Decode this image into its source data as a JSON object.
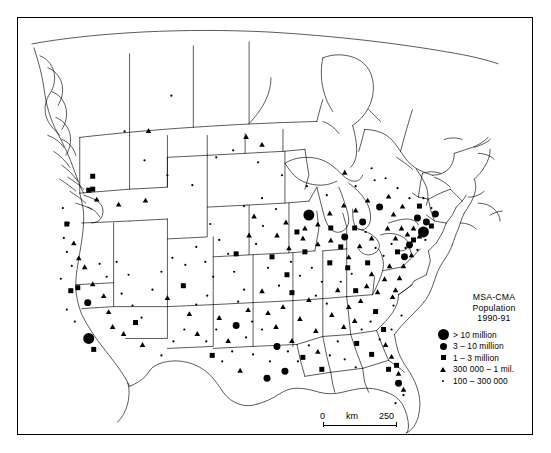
{
  "figure": {
    "background_color": "#ffffff",
    "symbol_color": "#000000",
    "border_color": "#000000"
  },
  "legend": {
    "title_line1": "MSA-CMA",
    "title_line2": "Population",
    "title_line3": "1990-91",
    "classes": [
      {
        "symbol": "large-circle",
        "label": "> 10 million",
        "size_px": 11.0
      },
      {
        "symbol": "medium-circle",
        "label": "3 – 10 million",
        "size_px": 7.0
      },
      {
        "symbol": "square",
        "label": "1 – 3 million",
        "size_px": 5.0
      },
      {
        "symbol": "triangle",
        "label": "300 000 – 1 mil.",
        "size_px": 5.4
      },
      {
        "symbol": "small-dot",
        "label": "100 – 300 000",
        "size_px": 2.2
      }
    ]
  },
  "scale": {
    "min_label": "0",
    "unit_label": "km",
    "max_label": "250"
  },
  "chart_data": {
    "type": "scatter",
    "title": "MSA-CMA Population 1990-91",
    "xlabel": "",
    "ylabel": "",
    "projection_note": "North America, conic projection, Canada and conterminous United States",
    "classes": [
      "> 10 million",
      "3 – 10 million",
      "1 – 3 million",
      "300 000 – 1 mil.",
      "100 – 300 000"
    ],
    "symbols": [
      "large-circle",
      "medium-circle",
      "square",
      "triangle",
      "small-dot"
    ],
    "points": [
      {
        "x": 88,
        "y": 339,
        "c": 0
      },
      {
        "x": 424,
        "y": 232,
        "c": 0
      },
      {
        "x": 309,
        "y": 215,
        "c": 0
      },
      {
        "x": 380,
        "y": 207,
        "c": 1
      },
      {
        "x": 418,
        "y": 218,
        "c": 1
      },
      {
        "x": 410,
        "y": 245,
        "c": 1
      },
      {
        "x": 405,
        "y": 257,
        "c": 1
      },
      {
        "x": 427,
        "y": 222,
        "c": 1
      },
      {
        "x": 436,
        "y": 214,
        "c": 1
      },
      {
        "x": 363,
        "y": 222,
        "c": 1
      },
      {
        "x": 345,
        "y": 237,
        "c": 1
      },
      {
        "x": 236,
        "y": 326,
        "c": 1
      },
      {
        "x": 277,
        "y": 347,
        "c": 1
      },
      {
        "x": 267,
        "y": 379,
        "c": 1
      },
      {
        "x": 285,
        "y": 372,
        "c": 1
      },
      {
        "x": 399,
        "y": 384,
        "c": 1
      },
      {
        "x": 87,
        "y": 303,
        "c": 1
      },
      {
        "x": 92,
        "y": 176,
        "c": 2
      },
      {
        "x": 92,
        "y": 189,
        "c": 2
      },
      {
        "x": 88,
        "y": 190,
        "c": 2
      },
      {
        "x": 66,
        "y": 224,
        "c": 2
      },
      {
        "x": 70,
        "y": 291,
        "c": 2
      },
      {
        "x": 77,
        "y": 288,
        "c": 2
      },
      {
        "x": 93,
        "y": 350,
        "c": 2
      },
      {
        "x": 135,
        "y": 323,
        "c": 2
      },
      {
        "x": 183,
        "y": 286,
        "c": 2
      },
      {
        "x": 236,
        "y": 254,
        "c": 2
      },
      {
        "x": 272,
        "y": 257,
        "c": 2
      },
      {
        "x": 287,
        "y": 275,
        "c": 2
      },
      {
        "x": 292,
        "y": 293,
        "c": 2
      },
      {
        "x": 305,
        "y": 252,
        "c": 2
      },
      {
        "x": 330,
        "y": 263,
        "c": 2
      },
      {
        "x": 341,
        "y": 247,
        "c": 2
      },
      {
        "x": 348,
        "y": 268,
        "c": 2
      },
      {
        "x": 356,
        "y": 291,
        "c": 2
      },
      {
        "x": 368,
        "y": 263,
        "c": 2
      },
      {
        "x": 376,
        "y": 312,
        "c": 2
      },
      {
        "x": 384,
        "y": 330,
        "c": 2
      },
      {
        "x": 303,
        "y": 358,
        "c": 2
      },
      {
        "x": 322,
        "y": 370,
        "c": 2
      },
      {
        "x": 212,
        "y": 356,
        "c": 2
      },
      {
        "x": 357,
        "y": 344,
        "c": 2
      },
      {
        "x": 372,
        "y": 355,
        "c": 2
      },
      {
        "x": 397,
        "y": 366,
        "c": 2
      },
      {
        "x": 389,
        "y": 370,
        "c": 2
      },
      {
        "x": 420,
        "y": 206,
        "c": 2
      },
      {
        "x": 432,
        "y": 226,
        "c": 2
      },
      {
        "x": 414,
        "y": 240,
        "c": 2
      },
      {
        "x": 398,
        "y": 252,
        "c": 2
      },
      {
        "x": 355,
        "y": 228,
        "c": 2
      },
      {
        "x": 331,
        "y": 228,
        "c": 2
      },
      {
        "x": 297,
        "y": 232,
        "c": 2
      },
      {
        "x": 148,
        "y": 130,
        "c": 3
      },
      {
        "x": 246,
        "y": 136,
        "c": 3
      },
      {
        "x": 262,
        "y": 144,
        "c": 3
      },
      {
        "x": 345,
        "y": 172,
        "c": 3
      },
      {
        "x": 96,
        "y": 199,
        "c": 3
      },
      {
        "x": 118,
        "y": 204,
        "c": 3
      },
      {
        "x": 145,
        "y": 200,
        "c": 3
      },
      {
        "x": 73,
        "y": 243,
        "c": 3
      },
      {
        "x": 78,
        "y": 258,
        "c": 3
      },
      {
        "x": 84,
        "y": 267,
        "c": 3
      },
      {
        "x": 92,
        "y": 284,
        "c": 3
      },
      {
        "x": 103,
        "y": 296,
        "c": 3
      },
      {
        "x": 108,
        "y": 312,
        "c": 3
      },
      {
        "x": 112,
        "y": 327,
        "c": 3
      },
      {
        "x": 123,
        "y": 334,
        "c": 3
      },
      {
        "x": 142,
        "y": 345,
        "c": 3
      },
      {
        "x": 167,
        "y": 298,
        "c": 3
      },
      {
        "x": 189,
        "y": 314,
        "c": 3
      },
      {
        "x": 197,
        "y": 334,
        "c": 3
      },
      {
        "x": 219,
        "y": 318,
        "c": 3
      },
      {
        "x": 228,
        "y": 341,
        "c": 3
      },
      {
        "x": 240,
        "y": 371,
        "c": 3
      },
      {
        "x": 248,
        "y": 310,
        "c": 3
      },
      {
        "x": 262,
        "y": 291,
        "c": 3
      },
      {
        "x": 268,
        "y": 313,
        "c": 3
      },
      {
        "x": 276,
        "y": 327,
        "c": 3
      },
      {
        "x": 283,
        "y": 307,
        "c": 3
      },
      {
        "x": 292,
        "y": 341,
        "c": 3
      },
      {
        "x": 300,
        "y": 319,
        "c": 3
      },
      {
        "x": 309,
        "y": 300,
        "c": 3
      },
      {
        "x": 316,
        "y": 331,
        "c": 3
      },
      {
        "x": 318,
        "y": 352,
        "c": 3
      },
      {
        "x": 332,
        "y": 315,
        "c": 3
      },
      {
        "x": 338,
        "y": 290,
        "c": 3
      },
      {
        "x": 344,
        "y": 327,
        "c": 3
      },
      {
        "x": 349,
        "y": 307,
        "c": 3
      },
      {
        "x": 355,
        "y": 321,
        "c": 3
      },
      {
        "x": 361,
        "y": 301,
        "c": 3
      },
      {
        "x": 367,
        "y": 286,
        "c": 3
      },
      {
        "x": 372,
        "y": 274,
        "c": 3
      },
      {
        "x": 378,
        "y": 292,
        "c": 3
      },
      {
        "x": 385,
        "y": 279,
        "c": 3
      },
      {
        "x": 390,
        "y": 266,
        "c": 3
      },
      {
        "x": 393,
        "y": 297,
        "c": 3
      },
      {
        "x": 386,
        "y": 345,
        "c": 3
      },
      {
        "x": 392,
        "y": 357,
        "c": 3
      },
      {
        "x": 399,
        "y": 374,
        "c": 3
      },
      {
        "x": 404,
        "y": 390,
        "c": 3
      },
      {
        "x": 331,
        "y": 240,
        "c": 3
      },
      {
        "x": 318,
        "y": 244,
        "c": 3
      },
      {
        "x": 303,
        "y": 238,
        "c": 3
      },
      {
        "x": 289,
        "y": 248,
        "c": 3
      },
      {
        "x": 277,
        "y": 235,
        "c": 3
      },
      {
        "x": 349,
        "y": 257,
        "c": 3
      },
      {
        "x": 360,
        "y": 246,
        "c": 3
      },
      {
        "x": 372,
        "y": 238,
        "c": 3
      },
      {
        "x": 388,
        "y": 228,
        "c": 3
      },
      {
        "x": 396,
        "y": 238,
        "c": 3
      },
      {
        "x": 402,
        "y": 228,
        "c": 3
      },
      {
        "x": 408,
        "y": 234,
        "c": 3
      },
      {
        "x": 414,
        "y": 228,
        "c": 3
      },
      {
        "x": 420,
        "y": 236,
        "c": 3
      },
      {
        "x": 412,
        "y": 255,
        "c": 3
      },
      {
        "x": 404,
        "y": 266,
        "c": 3
      },
      {
        "x": 400,
        "y": 278,
        "c": 3
      },
      {
        "x": 396,
        "y": 290,
        "c": 3
      },
      {
        "x": 368,
        "y": 200,
        "c": 3
      },
      {
        "x": 356,
        "y": 210,
        "c": 3
      },
      {
        "x": 344,
        "y": 205,
        "c": 3
      },
      {
        "x": 330,
        "y": 213,
        "c": 3
      },
      {
        "x": 318,
        "y": 224,
        "c": 3
      },
      {
        "x": 305,
        "y": 228,
        "c": 3
      },
      {
        "x": 286,
        "y": 222,
        "c": 3
      },
      {
        "x": 254,
        "y": 216,
        "c": 3
      },
      {
        "x": 249,
        "y": 235,
        "c": 3
      },
      {
        "x": 394,
        "y": 214,
        "c": 3
      },
      {
        "x": 403,
        "y": 206,
        "c": 3
      },
      {
        "x": 389,
        "y": 196,
        "c": 3
      },
      {
        "x": 124,
        "y": 131,
        "c": 4
      },
      {
        "x": 171,
        "y": 95,
        "c": 4
      },
      {
        "x": 144,
        "y": 160,
        "c": 4
      },
      {
        "x": 167,
        "y": 175,
        "c": 4
      },
      {
        "x": 192,
        "y": 185,
        "c": 4
      },
      {
        "x": 216,
        "y": 157,
        "c": 4
      },
      {
        "x": 233,
        "y": 150,
        "c": 4
      },
      {
        "x": 258,
        "y": 162,
        "c": 4
      },
      {
        "x": 282,
        "y": 175,
        "c": 4
      },
      {
        "x": 307,
        "y": 186,
        "c": 4
      },
      {
        "x": 327,
        "y": 195,
        "c": 4
      },
      {
        "x": 356,
        "y": 186,
        "c": 4
      },
      {
        "x": 375,
        "y": 180,
        "c": 4
      },
      {
        "x": 62,
        "y": 208,
        "c": 4
      },
      {
        "x": 68,
        "y": 223,
        "c": 4
      },
      {
        "x": 63,
        "y": 238,
        "c": 4
      },
      {
        "x": 66,
        "y": 252,
        "c": 4
      },
      {
        "x": 71,
        "y": 266,
        "c": 4
      },
      {
        "x": 60,
        "y": 279,
        "c": 4
      },
      {
        "x": 66,
        "y": 310,
        "c": 4
      },
      {
        "x": 74,
        "y": 322,
        "c": 4
      },
      {
        "x": 99,
        "y": 264,
        "c": 4
      },
      {
        "x": 106,
        "y": 277,
        "c": 4
      },
      {
        "x": 116,
        "y": 262,
        "c": 4
      },
      {
        "x": 128,
        "y": 275,
        "c": 4
      },
      {
        "x": 121,
        "y": 294,
        "c": 4
      },
      {
        "x": 132,
        "y": 306,
        "c": 4
      },
      {
        "x": 141,
        "y": 318,
        "c": 4
      },
      {
        "x": 152,
        "y": 290,
        "c": 4
      },
      {
        "x": 161,
        "y": 272,
        "c": 4
      },
      {
        "x": 172,
        "y": 258,
        "c": 4
      },
      {
        "x": 185,
        "y": 265,
        "c": 4
      },
      {
        "x": 196,
        "y": 247,
        "c": 4
      },
      {
        "x": 205,
        "y": 262,
        "c": 4
      },
      {
        "x": 213,
        "y": 277,
        "c": 4
      },
      {
        "x": 207,
        "y": 296,
        "c": 4
      },
      {
        "x": 196,
        "y": 305,
        "c": 4
      },
      {
        "x": 184,
        "y": 330,
        "c": 4
      },
      {
        "x": 173,
        "y": 342,
        "c": 4
      },
      {
        "x": 161,
        "y": 356,
        "c": 4
      },
      {
        "x": 206,
        "y": 342,
        "c": 4
      },
      {
        "x": 216,
        "y": 330,
        "c": 4
      },
      {
        "x": 222,
        "y": 362,
        "c": 4
      },
      {
        "x": 232,
        "y": 352,
        "c": 4
      },
      {
        "x": 246,
        "y": 338,
        "c": 4
      },
      {
        "x": 253,
        "y": 355,
        "c": 4
      },
      {
        "x": 244,
        "y": 290,
        "c": 4
      },
      {
        "x": 234,
        "y": 272,
        "c": 4
      },
      {
        "x": 228,
        "y": 254,
        "c": 4
      },
      {
        "x": 219,
        "y": 240,
        "c": 4
      },
      {
        "x": 210,
        "y": 224,
        "c": 4
      },
      {
        "x": 244,
        "y": 206,
        "c": 4
      },
      {
        "x": 262,
        "y": 198,
        "c": 4
      },
      {
        "x": 276,
        "y": 209,
        "c": 4
      },
      {
        "x": 263,
        "y": 226,
        "c": 4
      },
      {
        "x": 256,
        "y": 244,
        "c": 4
      },
      {
        "x": 268,
        "y": 268,
        "c": 4
      },
      {
        "x": 279,
        "y": 286,
        "c": 4
      },
      {
        "x": 291,
        "y": 262,
        "c": 4
      },
      {
        "x": 300,
        "y": 276,
        "c": 4
      },
      {
        "x": 312,
        "y": 268,
        "c": 4
      },
      {
        "x": 322,
        "y": 282,
        "c": 4
      },
      {
        "x": 316,
        "y": 296,
        "c": 4
      },
      {
        "x": 327,
        "y": 304,
        "c": 4
      },
      {
        "x": 338,
        "y": 342,
        "c": 4
      },
      {
        "x": 330,
        "y": 356,
        "c": 4
      },
      {
        "x": 345,
        "y": 360,
        "c": 4
      },
      {
        "x": 356,
        "y": 368,
        "c": 4
      },
      {
        "x": 309,
        "y": 346,
        "c": 4
      },
      {
        "x": 298,
        "y": 362,
        "c": 4
      },
      {
        "x": 288,
        "y": 352,
        "c": 4
      },
      {
        "x": 270,
        "y": 362,
        "c": 4
      },
      {
        "x": 262,
        "y": 330,
        "c": 4
      },
      {
        "x": 252,
        "y": 322,
        "c": 4
      },
      {
        "x": 238,
        "y": 302,
        "c": 4
      },
      {
        "x": 341,
        "y": 282,
        "c": 4
      },
      {
        "x": 352,
        "y": 274,
        "c": 4
      },
      {
        "x": 362,
        "y": 330,
        "c": 4
      },
      {
        "x": 371,
        "y": 322,
        "c": 4
      },
      {
        "x": 380,
        "y": 340,
        "c": 4
      },
      {
        "x": 392,
        "y": 330,
        "c": 4
      },
      {
        "x": 402,
        "y": 316,
        "c": 4
      },
      {
        "x": 394,
        "y": 306,
        "c": 4
      },
      {
        "x": 384,
        "y": 256,
        "c": 4
      },
      {
        "x": 376,
        "y": 248,
        "c": 4
      },
      {
        "x": 366,
        "y": 232,
        "c": 4
      },
      {
        "x": 392,
        "y": 244,
        "c": 4
      },
      {
        "x": 406,
        "y": 248,
        "c": 4
      },
      {
        "x": 418,
        "y": 250,
        "c": 4
      },
      {
        "x": 426,
        "y": 240,
        "c": 4
      },
      {
        "x": 432,
        "y": 208,
        "c": 4
      },
      {
        "x": 424,
        "y": 198,
        "c": 4
      },
      {
        "x": 410,
        "y": 198,
        "c": 4
      },
      {
        "x": 398,
        "y": 188,
        "c": 4
      },
      {
        "x": 386,
        "y": 178,
        "c": 4
      },
      {
        "x": 372,
        "y": 168,
        "c": 4
      },
      {
        "x": 404,
        "y": 396,
        "c": 4
      },
      {
        "x": 396,
        "y": 404,
        "c": 4
      }
    ]
  }
}
